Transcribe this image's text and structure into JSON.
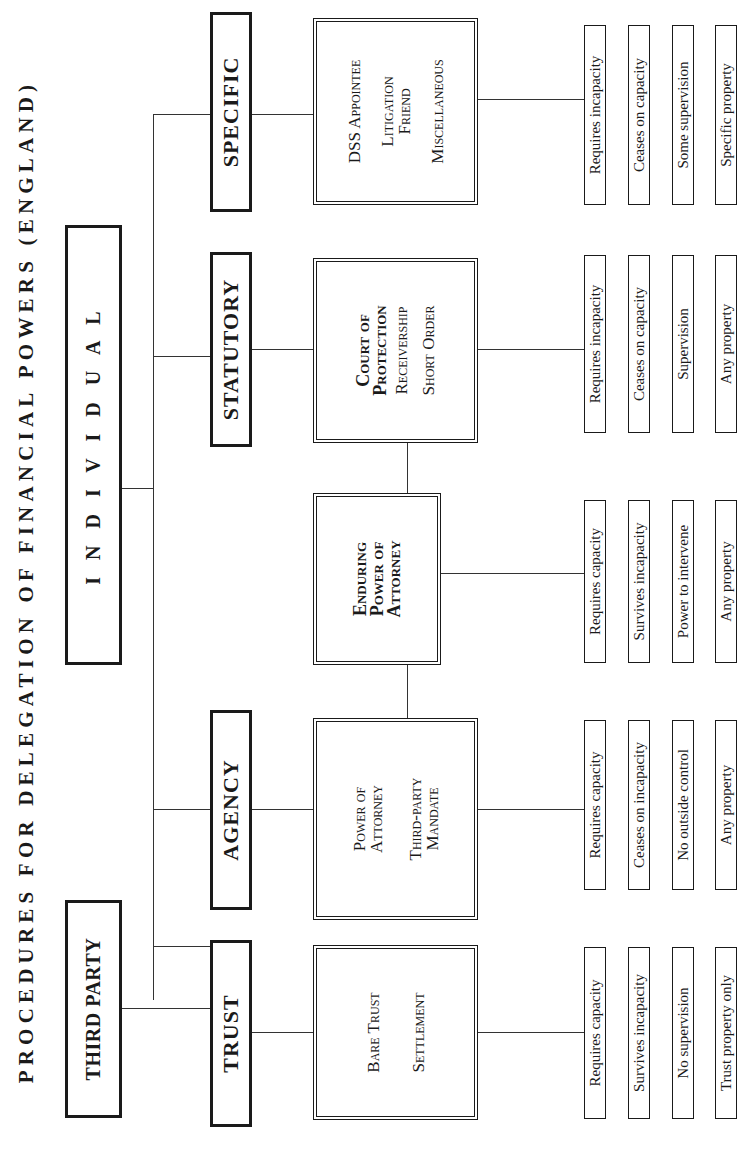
{
  "title": "PROCEDURES FOR DELEGATION OF FINANCIAL POWERS (ENGLAND)",
  "top_level": {
    "third_party": "THIRD PARTY",
    "individual": "I N D I V I D U A L"
  },
  "categories": [
    {
      "name": "TRUST",
      "details": [
        "Bare Trust",
        "Settlement"
      ],
      "attributes": [
        "Requires capacity",
        "Survives incapacity",
        "No supervision",
        "Trust property only"
      ]
    },
    {
      "name": "AGENCY",
      "details": [
        "Power of Attorney",
        "Third-party Mandate"
      ],
      "attributes": [
        "Requires capacity",
        "Ceases on incapacity",
        "No outside control",
        "Any property"
      ]
    },
    {
      "name": "",
      "details": [
        "Enduring Power of Attorney"
      ],
      "attributes": [
        "Requires capacity",
        "Survives incapacity",
        "Power to intervene",
        "Any property"
      ]
    },
    {
      "name": "STATUTORY",
      "details": [
        "Court of Protection",
        "Receivership",
        "Short Order"
      ],
      "attributes": [
        "Requires incapacity",
        "Ceases on capacity",
        "Supervision",
        "Any property"
      ]
    },
    {
      "name": "SPECIFIC",
      "details": [
        "DSS Appointee",
        "Litigation Friend",
        "Miscellaneous"
      ],
      "attributes": [
        "Requires incapacity",
        "Ceases on capacity",
        "Some supervision",
        "Specific property"
      ]
    }
  ],
  "colors": {
    "ink": "#1a1a1a",
    "background": "#ffffff"
  }
}
